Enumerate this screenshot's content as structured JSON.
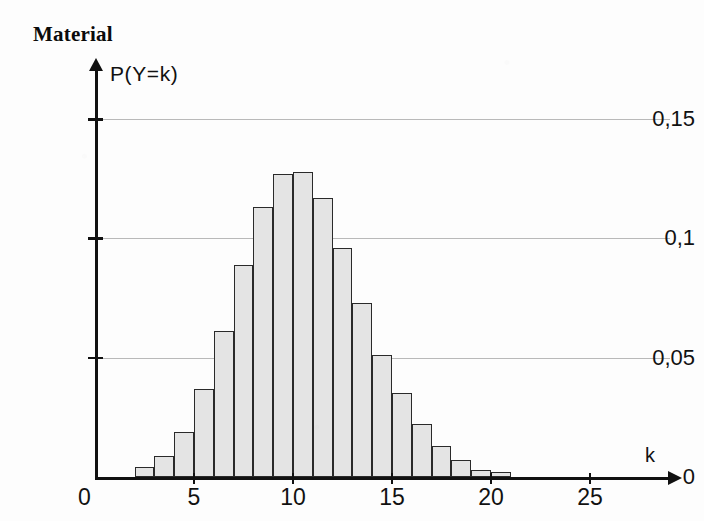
{
  "title": "Material",
  "chart_data": {
    "type": "bar",
    "title": "Material",
    "ylabel": "P(Y=k)",
    "xlabel": "k",
    "xlim": [
      0,
      27.5
    ],
    "ylim": [
      0,
      0.163
    ],
    "grid": true,
    "legend": null,
    "bar_alignment": "edge",
    "bar_width": 1,
    "x_ticks": [
      0,
      5,
      10,
      15,
      20,
      25
    ],
    "x_tick_labels": [
      "0",
      "5",
      "10",
      "15",
      "20",
      "25"
    ],
    "y_ticks": [
      0,
      0.05,
      0.1,
      0.15
    ],
    "y_tick_labels": [
      "0",
      "0,05",
      "0,1",
      "0,15"
    ],
    "categories": [
      2,
      3,
      4,
      5,
      6,
      7,
      8,
      9,
      10,
      11,
      12,
      13,
      14,
      15,
      16,
      17,
      18,
      19,
      20
    ],
    "values": [
      0.004,
      0.009,
      0.019,
      0.037,
      0.061,
      0.089,
      0.113,
      0.127,
      0.128,
      0.117,
      0.096,
      0.073,
      0.051,
      0.035,
      0.022,
      0.013,
      0.007,
      0.003,
      0.002
    ],
    "colors": {
      "bar_fill": "#e4e4e4",
      "bar_stroke": "#2a2a2a",
      "axis": "#111111",
      "gridline": "#b9b9b9",
      "background": "#fdfdfd",
      "text": "#111111"
    }
  }
}
